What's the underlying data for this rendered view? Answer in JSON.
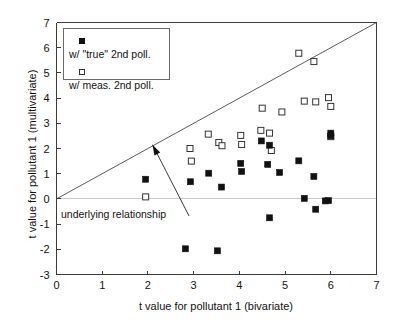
{
  "chart_data": {
    "type": "scatter",
    "title": "",
    "xlabel": "t value for pollutant 1 (bivariate)",
    "ylabel": "t value for pollutant 1 (multivariate)",
    "xlim": [
      0,
      7
    ],
    "ylim": [
      -3,
      7
    ],
    "xticks": [
      0,
      1,
      2,
      3,
      4,
      5,
      6,
      7
    ],
    "yticks": [
      -3,
      -2,
      -1,
      0,
      1,
      2,
      3,
      4,
      5,
      6,
      7
    ],
    "xtick_labels": [
      "0",
      "1",
      "2",
      "3",
      "4",
      "5",
      "6",
      "7"
    ],
    "ytick_labels": [
      "-3",
      "-2",
      "-1",
      "0",
      "1",
      "2",
      "3",
      "4",
      "5",
      "6",
      "7"
    ],
    "grid": false,
    "legend_position": "top-left",
    "reference_lines": [
      {
        "name": "identity-line",
        "kind": "line",
        "from": [
          0,
          0
        ],
        "to": [
          7,
          7
        ],
        "color": "#5a5a5a"
      },
      {
        "name": "zero-line",
        "kind": "horizontal",
        "y": 0,
        "color": "#c9c9c9"
      }
    ],
    "annotations": [
      {
        "name": "underlying-relationship",
        "text": "underlying relationship",
        "text_xy": [
          0.12,
          -0.36
        ],
        "arrow_tip": [
          2.1,
          2.15
        ],
        "arrow_tail": [
          2.9,
          -0.68
        ]
      }
    ],
    "series": [
      {
        "name": "w-true-2nd-poll",
        "label": "w/ \"true\" 2nd poll.",
        "marker": "filled-square",
        "color": "#111111",
        "points": [
          [
            1.95,
            0.78
          ],
          [
            2.82,
            -1.98
          ],
          [
            2.93,
            0.68
          ],
          [
            3.33,
            1.02
          ],
          [
            3.52,
            -2.06
          ],
          [
            3.61,
            0.47
          ],
          [
            4.03,
            1.41
          ],
          [
            4.05,
            1.09
          ],
          [
            4.48,
            2.3
          ],
          [
            4.62,
            1.37
          ],
          [
            4.66,
            2.13
          ],
          [
            4.66,
            -0.75
          ],
          [
            4.88,
            1.05
          ],
          [
            5.3,
            1.51
          ],
          [
            5.42,
            0.02
          ],
          [
            5.63,
            0.89
          ],
          [
            5.67,
            -0.41
          ],
          [
            5.88,
            -0.08
          ],
          [
            5.95,
            -0.07
          ],
          [
            6.0,
            2.61
          ],
          [
            6.0,
            2.5
          ]
        ]
      },
      {
        "name": "w-meas-2nd-poll",
        "label": "w/ meas. 2nd poll.",
        "marker": "open-square",
        "color": "#ffffff",
        "points": [
          [
            1.95,
            0.08
          ],
          [
            2.92,
            2.0
          ],
          [
            2.95,
            1.5
          ],
          [
            3.32,
            2.57
          ],
          [
            3.55,
            2.24
          ],
          [
            3.62,
            2.11
          ],
          [
            4.03,
            2.52
          ],
          [
            4.05,
            2.16
          ],
          [
            4.47,
            2.72
          ],
          [
            4.5,
            3.6
          ],
          [
            4.66,
            2.61
          ],
          [
            4.7,
            1.92
          ],
          [
            4.93,
            3.45
          ],
          [
            5.3,
            5.78
          ],
          [
            5.42,
            3.88
          ],
          [
            5.63,
            5.45
          ],
          [
            5.67,
            3.85
          ],
          [
            5.95,
            4.02
          ],
          [
            6.0,
            3.67
          ],
          [
            6.0,
            2.47
          ]
        ]
      }
    ]
  },
  "legend": {
    "entries": [
      {
        "label": "w/ \"true\" 2nd poll.",
        "marker": "filled-square"
      },
      {
        "label": "w/ meas. 2nd poll.",
        "marker": "open-square"
      }
    ]
  },
  "axes": {
    "x_title": "t value for pollutant 1 (bivariate)",
    "y_title": "t value for pollutant 1 (multivariate)"
  },
  "annotation": {
    "text": "underlying relationship"
  }
}
